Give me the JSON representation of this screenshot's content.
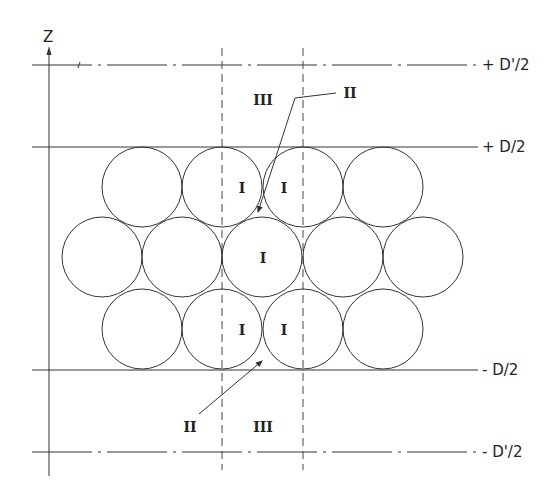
{
  "diagram": {
    "axis_label": "Z",
    "colors": {
      "line": "#333333",
      "background": "#ffffff"
    },
    "boundary_labels": {
      "top_outer": "+ D'/2",
      "top_inner": "+ D/2",
      "bottom_inner": "- D/2",
      "bottom_outer": "- D'/2"
    },
    "region_labels": {
      "region_I": "I",
      "region_II": "II",
      "region_III": "III"
    },
    "circles": {
      "radius": 40,
      "rows": [
        {
          "name": "top-row",
          "cy": 187,
          "cx": [
            142,
            222,
            303,
            383
          ]
        },
        {
          "name": "middle-row",
          "cy": 257,
          "cx": [
            102,
            182,
            262,
            343,
            423
          ]
        },
        {
          "name": "bottom-row",
          "cy": 329,
          "cx": [
            142,
            222,
            303,
            383
          ]
        }
      ]
    },
    "annotations": [
      {
        "text": "III",
        "region": "upper-gap",
        "x": 263,
        "y": 105
      },
      {
        "text": "II",
        "region": "upper-leader",
        "x": 343,
        "y": 98
      },
      {
        "text": "I",
        "region": "top-left-circle",
        "x": 242,
        "y": 193
      },
      {
        "text": "I",
        "region": "top-right-circle",
        "x": 284,
        "y": 193
      },
      {
        "text": "I",
        "region": "center-circle",
        "x": 263,
        "y": 263
      },
      {
        "text": "I",
        "region": "bottom-left-circle",
        "x": 242,
        "y": 335
      },
      {
        "text": "I",
        "region": "bottom-right-circle",
        "x": 284,
        "y": 335
      },
      {
        "text": "II",
        "region": "lower-leader",
        "x": 190,
        "y": 427
      },
      {
        "text": "III",
        "region": "lower-gap",
        "x": 263,
        "y": 427
      }
    ]
  }
}
